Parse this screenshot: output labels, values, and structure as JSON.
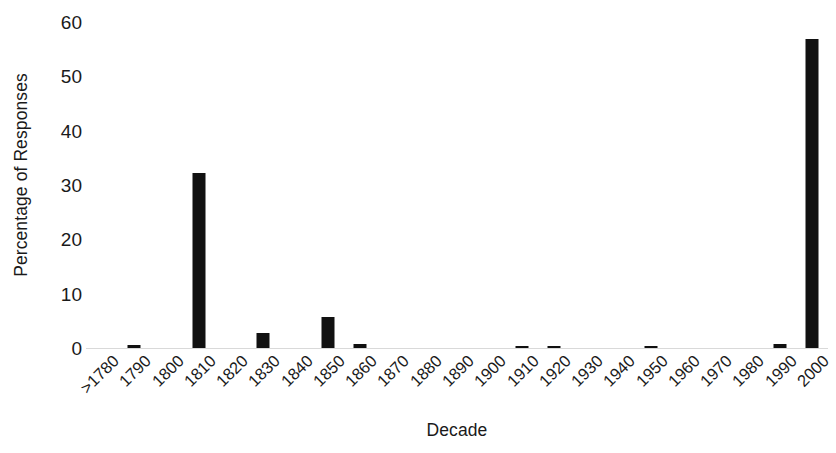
{
  "chart_data": {
    "type": "bar",
    "title": "",
    "xlabel": "Decade",
    "ylabel": "Percentage of Responses",
    "ylim": [
      0,
      60
    ],
    "yticks": [
      0,
      10,
      20,
      30,
      40,
      50,
      60
    ],
    "grid": false,
    "legend": null,
    "bar_color": "#111111",
    "categories": [
      ">1780",
      "1790",
      "1800",
      "1810",
      "1820",
      "1830",
      "1840",
      "1850",
      "1860",
      "1870",
      "1880",
      "1890",
      "1900",
      "1910",
      "1920",
      "1930",
      "1940",
      "1950",
      "1960",
      "1970",
      "1980",
      "1990",
      "2000"
    ],
    "values": [
      0,
      0.6,
      0,
      32.3,
      0,
      2.7,
      0,
      5.8,
      0.8,
      0,
      0,
      0,
      0,
      0.4,
      0.4,
      0,
      0,
      0.4,
      0,
      0,
      0,
      0.8,
      56.9
    ]
  }
}
